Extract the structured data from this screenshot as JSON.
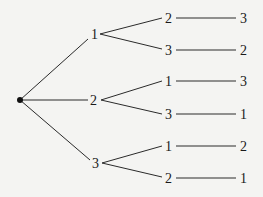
{
  "diagram": {
    "type": "tree",
    "root": {
      "x": 20,
      "y": 100
    },
    "level1": [
      {
        "label": "1",
        "x": 95,
        "y": 34
      },
      {
        "label": "2",
        "x": 94,
        "y": 100
      },
      {
        "label": "3",
        "x": 96,
        "y": 163
      }
    ],
    "level2": [
      {
        "label": "2",
        "x": 168,
        "y": 18
      },
      {
        "label": "3",
        "x": 168,
        "y": 50
      },
      {
        "label": "1",
        "x": 168,
        "y": 81
      },
      {
        "label": "3",
        "x": 168,
        "y": 114
      },
      {
        "label": "1",
        "x": 168,
        "y": 146
      },
      {
        "label": "2",
        "x": 168,
        "y": 178
      }
    ],
    "level3": [
      {
        "label": "3",
        "x": 244,
        "y": 18
      },
      {
        "label": "2",
        "x": 244,
        "y": 50
      },
      {
        "label": "3",
        "x": 244,
        "y": 81
      },
      {
        "label": "1",
        "x": 244,
        "y": 114
      },
      {
        "label": "2",
        "x": 244,
        "y": 146
      },
      {
        "label": "1",
        "x": 244,
        "y": 178
      }
    ]
  }
}
